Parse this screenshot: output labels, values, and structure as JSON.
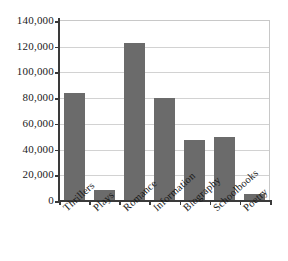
{
  "chart_data": {
    "type": "bar",
    "title": "",
    "subtitle": "",
    "xlabel": "",
    "ylabel": "",
    "categories": [
      "Thrillers",
      "Plays",
      "Romance",
      "Information",
      "Biography",
      "Schoolbooks",
      "Poetry"
    ],
    "values": [
      83000,
      8000,
      122000,
      79500,
      46500,
      49000,
      5000
    ],
    "ylim": [
      0,
      140000
    ],
    "ytick_step": 20000,
    "ytick_labels": [
      "0",
      "20,000",
      "40,000",
      "60,000",
      "80,000",
      "100,000",
      "120,000",
      "140,000"
    ],
    "ytick_values": [
      0,
      20000,
      40000,
      60000,
      80000,
      100000,
      120000,
      140000
    ],
    "grid": "horizontal",
    "legend": "none",
    "bar_color": "#6b6b6b",
    "gridline_color": "#d2d2d2",
    "axis_color": "#3a3a3a",
    "frame_color": "#c8c8c8",
    "background_color": "#ffffff"
  }
}
